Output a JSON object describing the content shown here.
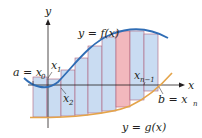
{
  "figure": {
    "colors": {
      "rect_fill": "#c9dcf2",
      "rect_stroke": "#b0627a",
      "highlight_fill": "#f2b8bd",
      "curve_f": "#2f6db5",
      "curve_g": "#e4a44a",
      "axis": "#231f20"
    },
    "axes": {
      "x_label": "x",
      "y_label": "y"
    },
    "curves": {
      "f_label": "y = f(x)",
      "g_label": "y = g(x)"
    },
    "points": {
      "a_label": "a = x",
      "a_sub": "0",
      "x1_label": "x",
      "x1_sub": "1",
      "x2_label": "x",
      "x2_sub": "2",
      "xn1_label": "x",
      "xn1_sub": "n−1",
      "b_label": "b = x",
      "b_sub": "n"
    },
    "strips": [
      {
        "x0": 33,
        "x1": 47,
        "top": 77,
        "bottom": 117,
        "highlight": false
      },
      {
        "x0": 47,
        "x1": 61,
        "top": 79,
        "bottom": 117,
        "highlight": false
      },
      {
        "x0": 61,
        "x1": 75,
        "top": 70,
        "bottom": 116,
        "highlight": false
      },
      {
        "x0": 75,
        "x1": 88,
        "top": 58,
        "bottom": 115,
        "highlight": false
      },
      {
        "x0": 88,
        "x1": 102,
        "top": 46,
        "bottom": 113,
        "highlight": false
      },
      {
        "x0": 102,
        "x1": 116,
        "top": 37,
        "bottom": 111,
        "highlight": false
      },
      {
        "x0": 116,
        "x1": 130,
        "top": 31,
        "bottom": 107,
        "highlight": true
      },
      {
        "x0": 130,
        "x1": 144,
        "top": 31,
        "bottom": 100,
        "highlight": false
      },
      {
        "x0": 144,
        "x1": 158,
        "top": 34,
        "bottom": 91,
        "highlight": false
      }
    ]
  }
}
